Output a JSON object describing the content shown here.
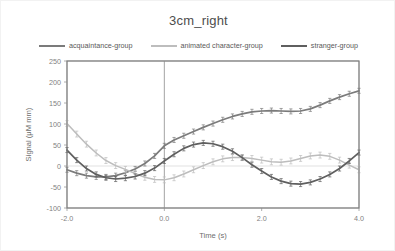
{
  "chart_data": {
    "type": "line",
    "title": "3cm_right",
    "xlabel": "Time (s)",
    "ylabel": "Signal (μM mm)",
    "xlim": [
      -2.0,
      4.0
    ],
    "ylim": [
      -100,
      250
    ],
    "xticks": [
      "-2.0",
      "0.0",
      "2.0",
      "4.0"
    ],
    "xtick_values": [
      -2.0,
      0.0,
      2.0,
      4.0
    ],
    "yticks": [
      "250",
      "200",
      "150",
      "100",
      "50",
      "0",
      "-50",
      "-100"
    ],
    "ytick_values": [
      250,
      200,
      150,
      100,
      50,
      0,
      -50,
      -100
    ],
    "grid": false,
    "zero_line": true,
    "event_line_x": 0.0,
    "legend_position": "top",
    "error_bars": true,
    "x": [
      -2.0,
      -1.8,
      -1.6,
      -1.4,
      -1.2,
      -1.0,
      -0.8,
      -0.6,
      -0.4,
      -0.2,
      0.0,
      0.2,
      0.4,
      0.6,
      0.8,
      1.0,
      1.2,
      1.4,
      1.6,
      1.8,
      2.0,
      2.2,
      2.4,
      2.6,
      2.8,
      3.0,
      3.2,
      3.4,
      3.6,
      3.8,
      4.0
    ],
    "series": [
      {
        "name": "acquaintance-group",
        "color": "#7b7b7b",
        "err": 6,
        "values": [
          -9,
          -17,
          -23,
          -26,
          -26,
          -23,
          -16,
          -7,
          6,
          24,
          48,
          62,
          72,
          82,
          92,
          101,
          110,
          118,
          124,
          129,
          131,
          132,
          131,
          130,
          131,
          136,
          145,
          155,
          164,
          172,
          179
        ]
      },
      {
        "name": "animated character-group",
        "color": "#bdbdbd",
        "err": 7,
        "values": [
          101,
          76,
          52,
          31,
          13,
          1,
          -8,
          -18,
          -27,
          -32,
          -33,
          -28,
          -19,
          -9,
          1,
          10,
          17,
          20,
          20,
          18,
          14,
          10,
          9,
          12,
          18,
          24,
          26,
          23,
          14,
          2,
          -9
        ]
      },
      {
        "name": "stranger-group",
        "color": "#5f5f5f",
        "err": 6,
        "values": [
          38,
          14,
          -6,
          -20,
          -28,
          -31,
          -29,
          -25,
          -17,
          -5,
          12,
          28,
          42,
          51,
          55,
          53,
          46,
          35,
          20,
          3,
          -12,
          -26,
          -36,
          -42,
          -43,
          -39,
          -31,
          -20,
          -6,
          12,
          32
        ]
      }
    ]
  }
}
